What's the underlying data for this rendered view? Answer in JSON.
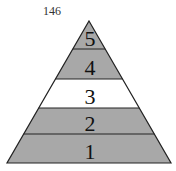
{
  "page_number": "146",
  "pyramid": {
    "levels": [
      {
        "label": "5",
        "shaded": true
      },
      {
        "label": "4",
        "shaded": true
      },
      {
        "label": "3",
        "shaded": false
      },
      {
        "label": "2",
        "shaded": true
      },
      {
        "label": "1",
        "shaded": true
      }
    ],
    "colors": {
      "shade": "#a8a8a8",
      "empty": "#ffffff",
      "stroke": "#222222"
    }
  }
}
